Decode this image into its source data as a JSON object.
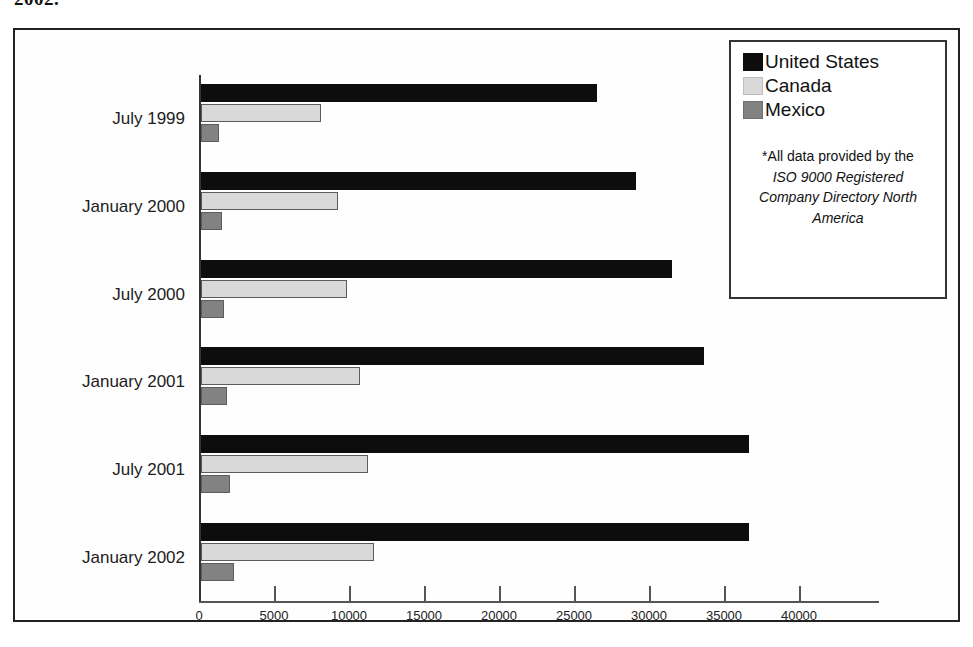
{
  "caption_fragment": "2002.",
  "legend": {
    "entries": [
      {
        "label": "United States",
        "color": "#0d0d0d",
        "key": "us"
      },
      {
        "label": "Canada",
        "color": "#d9d9d9",
        "key": "canada"
      },
      {
        "label": "Mexico",
        "color": "#828282",
        "key": "mexico"
      }
    ],
    "note_lead": "*All data provided by the",
    "note_italic": "ISO 9000 Registered Company Directory North America"
  },
  "axis": {
    "ticks": [
      0,
      5000,
      10000,
      15000,
      20000,
      25000,
      30000,
      35000,
      40000
    ],
    "tick_labels": [
      "0",
      "5000",
      "10000",
      "15000",
      "20000",
      "25000",
      "30000",
      "35000",
      "40000"
    ]
  },
  "chart_data": {
    "type": "bar",
    "orientation": "horizontal",
    "title": "",
    "xlabel": "",
    "ylabel": "",
    "xlim": [
      0,
      40000
    ],
    "grid": false,
    "legend_position": "top-right",
    "categories": [
      "July 1999",
      "January 2000",
      "July 2000",
      "January 2001",
      "July 2001",
      "January 2002"
    ],
    "series": [
      {
        "name": "United States",
        "color": "#0d0d0d",
        "values": [
          26400,
          29000,
          31400,
          33500,
          36500,
          36500
        ]
      },
      {
        "name": "Canada",
        "color": "#d9d9d9",
        "values": [
          8000,
          9100,
          9700,
          10600,
          11100,
          11500
        ]
      },
      {
        "name": "Mexico",
        "color": "#828282",
        "values": [
          1200,
          1400,
          1500,
          1700,
          1900,
          2200
        ]
      }
    ]
  }
}
